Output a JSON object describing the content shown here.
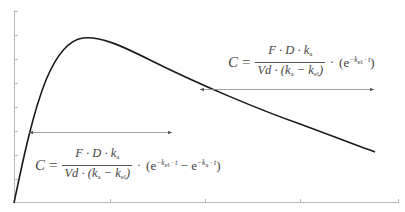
{
  "figure": {
    "axes": {
      "color": "#b0b0b0",
      "y_ticks_px": [
        11,
        35,
        59,
        83,
        107,
        131,
        155,
        179
      ],
      "x_ticks_px": [
        110,
        205,
        300,
        398
      ]
    },
    "curve_color": "#1a1a1a",
    "arrow_color": "#888888",
    "annotations": {
      "elimination_phase": {
        "lhs": "C",
        "eq": "=",
        "numerator": "F · D · k",
        "numerator_sub": "a",
        "denominator_prefix": "Vd · (k",
        "denominator_sub1": "a",
        "denominator_mid": " − k",
        "denominator_sub2": "el",
        "denominator_suffix": ")",
        "dot": "·",
        "term_open": "(e",
        "term_exp": "−k",
        "term_exp_sub": "el",
        "term_exp_tail": " · t",
        "term_close": ")"
      },
      "full_curve": {
        "lhs": "C",
        "eq": "=",
        "numerator": "F · D · k",
        "numerator_sub": "a",
        "denominator_prefix": "Vd · (k",
        "denominator_sub1": "a",
        "denominator_mid": " − k",
        "denominator_sub2": "el",
        "denominator_suffix": ")",
        "dot": "·",
        "term_open": "(e",
        "term1_exp": "−k",
        "term1_exp_sub": "el",
        "term1_exp_tail": " · t",
        "minus": " − e",
        "term2_exp": "−k",
        "term2_exp_sub": "a",
        "term2_exp_tail": " · t",
        "term_close": ")"
      }
    }
  }
}
